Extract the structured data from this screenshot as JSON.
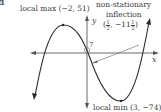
{
  "part_label": "d",
  "axes": {
    "x_label": "x",
    "y_label": "y"
  },
  "annotations": {
    "local_max": {
      "text": "local max",
      "coords": "(−2, 51)",
      "x": -2,
      "y": 51
    },
    "local_min": {
      "text": "local min",
      "coords": "(3, −74)",
      "x": 3,
      "y": -74
    },
    "inflection": {
      "line1": "non-stationary",
      "line2": "inflection",
      "open": "(",
      "x_num": "1",
      "x_den": "2",
      "sep": ", −11",
      "y_num": "1",
      "y_den": "2",
      "close": ")",
      "x": 0.5,
      "y": -11.5
    },
    "y_intercept": "7"
  },
  "colors": {
    "curve": "#2b2b2b",
    "axes": "#6a6a6a",
    "text": "#3a3a3a"
  }
}
